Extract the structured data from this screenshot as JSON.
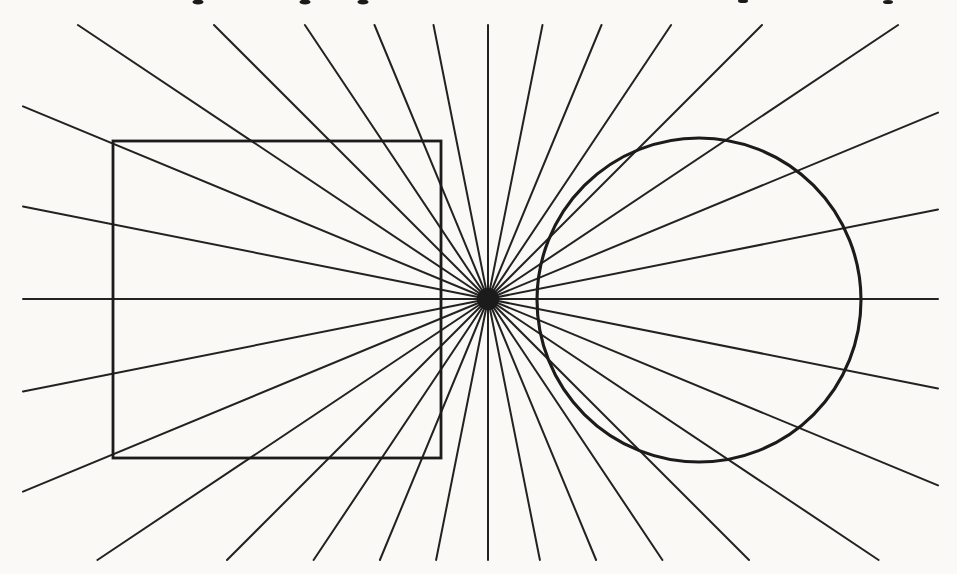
{
  "figure": {
    "type": "orbison-illusion",
    "description_label": "",
    "canvas": {
      "width": 957,
      "height": 574
    },
    "colors": {
      "paper": "#faf9f5",
      "ink": "#1b1b1b",
      "ray_ink": "#222222"
    },
    "rays": {
      "center_x": 488,
      "center_y": 299,
      "count": 32,
      "start_angle_deg": 0,
      "angle_step_deg": 11.25,
      "stroke_width": 2,
      "clip": {
        "x_min": 23,
        "y_min": 25,
        "x_max": 938,
        "y_max": 560
      }
    },
    "center_dot": {
      "cx": 488,
      "cy": 299,
      "r": 11
    },
    "square": {
      "x": 113,
      "y": 141,
      "width": 328,
      "height": 317,
      "stroke_width": 2.8
    },
    "circle": {
      "cx": 699,
      "cy": 300,
      "r": 162,
      "stroke_width": 3.1
    },
    "text_fragments": [
      {
        "x": 198,
        "y": 2,
        "w": 11,
        "h": 5
      },
      {
        "x": 305,
        "y": 2,
        "w": 11,
        "h": 5
      },
      {
        "x": 363,
        "y": 2,
        "w": 11,
        "h": 5
      },
      {
        "x": 743,
        "y": 1,
        "w": 10,
        "h": 4
      },
      {
        "x": 888,
        "y": 2,
        "w": 10,
        "h": 4
      }
    ]
  }
}
